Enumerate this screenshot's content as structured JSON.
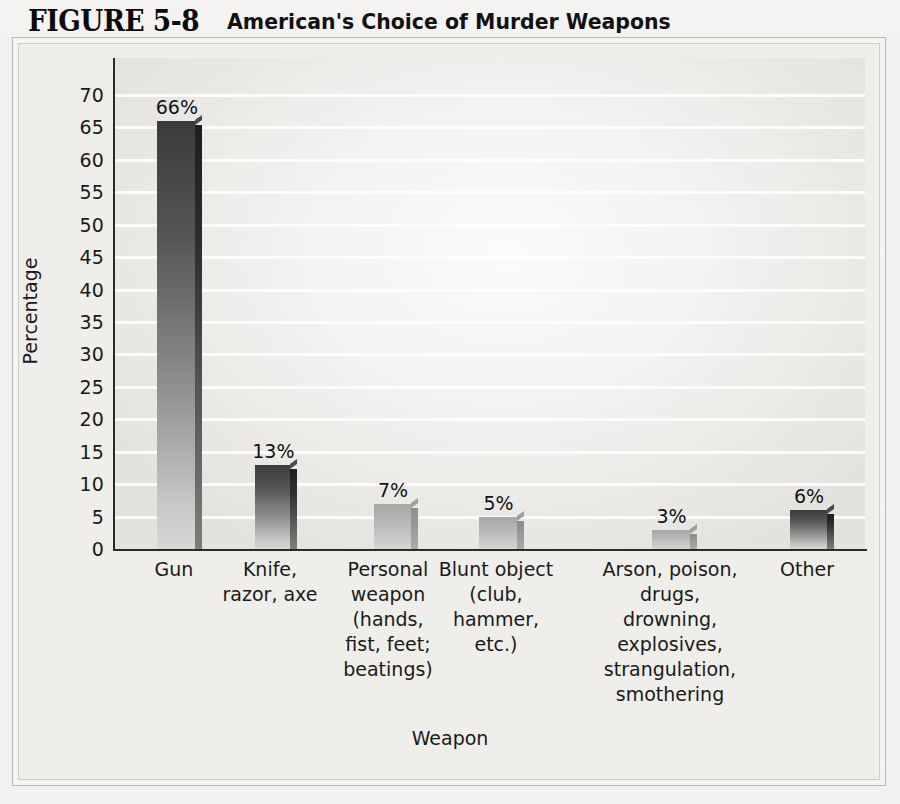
{
  "figure": {
    "number": "FIGURE 5-8",
    "title": "American's Choice of Murder Weapons"
  },
  "chart_data": {
    "type": "bar",
    "title": "American's Choice of Murder Weapons",
    "xlabel": "Weapon",
    "ylabel": "Percentage",
    "ylim": [
      0,
      70
    ],
    "ytick_step": 5,
    "grid": true,
    "legend": "none",
    "yticks": [
      "70",
      "65",
      "60",
      "55",
      "50",
      "45",
      "40",
      "35",
      "30",
      "25",
      "20",
      "15",
      "10",
      "5",
      "0"
    ],
    "categories": [
      "Gun",
      "Knife,\nrazor, axe",
      "Personal\nweapon\n(hands,\nfist, feet;\nbeatings)",
      "Blunt object\n(club,\nhammer,\netc.)",
      "Arson, poison,\ndrugs,\ndrowning,\nexplosives,\nstrangulation,\nsmothering",
      "Other"
    ],
    "values": [
      66,
      13,
      7,
      5,
      3,
      6
    ],
    "value_labels": [
      "66%",
      "13%",
      "7%",
      "5%",
      "3%",
      "6%"
    ],
    "bars": [
      {
        "category": "Gun",
        "lines": [
          "Gun"
        ],
        "value": 66,
        "label": "66%",
        "tone": "dark",
        "x": 155,
        "width": 38,
        "label_x": 115,
        "label_w": 118
      },
      {
        "category": "Knife, razor, axe",
        "lines": [
          "Knife,",
          "razor, axe"
        ],
        "value": 13,
        "label": "13%",
        "tone": "dark",
        "x": 253,
        "width": 35,
        "label_x": 205,
        "label_w": 130
      },
      {
        "category": "Personal weapon (hands, fist, feet; beatings)",
        "lines": [
          "Personal",
          "weapon",
          "(hands,",
          "fist, feet;",
          "beatings)"
        ],
        "value": 7,
        "label": "7%",
        "tone": "light",
        "x": 372,
        "width": 37,
        "label_x": 317,
        "label_w": 142
      },
      {
        "category": "Blunt object (club, hammer, etc.)",
        "lines": [
          "Blunt object",
          "(club,",
          "hammer,",
          "etc.)"
        ],
        "value": 5,
        "label": "5%",
        "tone": "light",
        "x": 477,
        "width": 38,
        "label_x": 422,
        "label_w": 148
      },
      {
        "category": "Arson, poison, drugs, drowning, explosives, strangulation, smothering",
        "lines": [
          "Arson, poison,",
          "drugs,",
          "drowning,",
          "explosives,",
          "strangulation,",
          "smothering"
        ],
        "value": 3,
        "label": "3%",
        "tone": "light",
        "x": 650,
        "width": 38,
        "label_x": 578,
        "label_w": 184
      },
      {
        "category": "Other",
        "lines": [
          "Other"
        ],
        "value": 6,
        "label": "6%",
        "tone": "dark",
        "x": 788,
        "width": 37,
        "label_x": 748,
        "label_w": 118
      }
    ]
  }
}
